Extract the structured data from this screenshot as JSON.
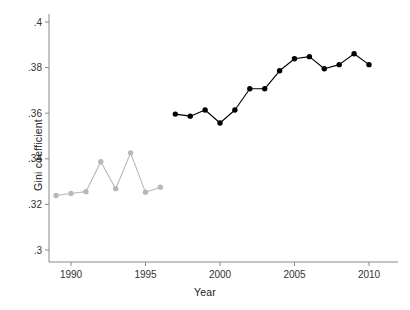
{
  "chart_data": {
    "type": "line",
    "title": "",
    "xlabel": "Year",
    "ylabel": "Gini coefficient",
    "xlim": [
      1988.4,
      2011.0
    ],
    "ylim": [
      0.3,
      0.4
    ],
    "xticks": [
      1990,
      1995,
      2000,
      2005,
      2010
    ],
    "xticklabels": [
      "1990",
      "1995",
      "2000",
      "2005",
      "2010"
    ],
    "yticks": [
      0.3,
      0.32,
      0.34,
      0.36,
      0.38,
      0.4
    ],
    "yticklabels": [
      ".3",
      ".32",
      ".34",
      ".36",
      ".38",
      ".4"
    ],
    "grid": false,
    "legend": "none",
    "series": [
      {
        "name": "early-period-series",
        "color": "#b8b8b8",
        "marker": "circle",
        "x": [
          1989,
          1990,
          1991,
          1992,
          1993,
          1994,
          1995,
          1996
        ],
        "values": [
          0.3239,
          0.3248,
          0.3256,
          0.3387,
          0.3269,
          0.3426,
          0.3253,
          0.3275
        ]
      },
      {
        "name": "later-period-series",
        "color": "#000000",
        "marker": "circle",
        "x": [
          1997,
          1998,
          1999,
          2000,
          2001,
          2002,
          2003,
          2004,
          2005,
          2006,
          2007,
          2008,
          2009,
          2010
        ],
        "values": [
          0.3596,
          0.3587,
          0.3614,
          0.3557,
          0.3614,
          0.3707,
          0.3707,
          0.3786,
          0.3839,
          0.3848,
          0.3795,
          0.3813,
          0.3861,
          0.3813
        ]
      }
    ]
  }
}
